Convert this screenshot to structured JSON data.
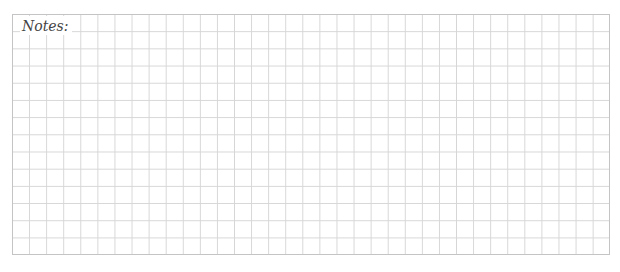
{
  "notes": {
    "label": "Notes:",
    "grid": {
      "columns": 35,
      "rows": 14,
      "line_color": "#d6d6d6",
      "border_color": "#c4c4c4"
    }
  }
}
